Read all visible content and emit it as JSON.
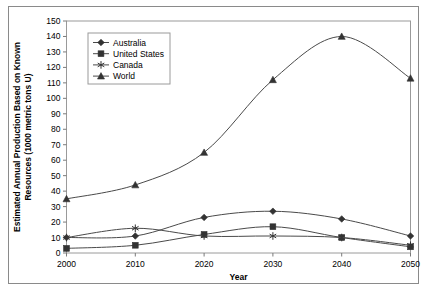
{
  "chart_data": {
    "type": "line",
    "title": "",
    "xlabel": "Year",
    "ylabel": "Estimated Annual Production Based on Known Resources (1000 metric tons U)",
    "x": [
      2000,
      2010,
      2020,
      2030,
      2040,
      2050
    ],
    "xtick_labels": [
      "2000",
      "2010",
      "2020",
      "2030",
      "2040",
      "2050"
    ],
    "ytick_labels": [
      "0",
      "10",
      "20",
      "30",
      "40",
      "50",
      "60",
      "70",
      "80",
      "90",
      "100",
      "110",
      "120",
      "130",
      "140",
      "150"
    ],
    "xlim": [
      2000,
      2050
    ],
    "ylim": [
      0,
      150
    ],
    "ystep": 10,
    "xstep": 10,
    "grid": false,
    "legend_position": "top-left-inside",
    "series": [
      {
        "name": "Australia",
        "marker": "diamond",
        "color": "#333333",
        "values": [
          10,
          11,
          23,
          27,
          22,
          11
        ]
      },
      {
        "name": "United States",
        "marker": "square",
        "color": "#333333",
        "values": [
          3,
          5,
          12,
          17,
          10,
          4
        ]
      },
      {
        "name": "Canada",
        "marker": "asterisk",
        "color": "#333333",
        "values": [
          10,
          16,
          11,
          11,
          10,
          5
        ]
      },
      {
        "name": "World",
        "marker": "triangle",
        "color": "#333333",
        "values": [
          35,
          44,
          65,
          112,
          140,
          113
        ]
      }
    ]
  }
}
